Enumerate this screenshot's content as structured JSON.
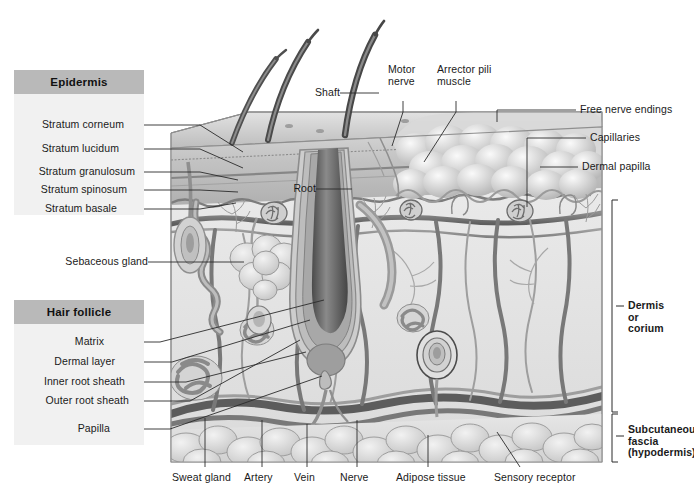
{
  "figure": {
    "type": "anatomical-diagram",
    "palette": {
      "panel_bg": "#f1f1f1",
      "panel_header_bg": "#b9b9b9",
      "epidermis_fill": "#c9c9c9",
      "dermis_fill": "#e8e8e8",
      "vessel_dark": "#6f6f6f",
      "hair_dark": "#5a5a5a",
      "fat_fill": "#dcdcdc",
      "leader_line": "#2a2a2a"
    }
  },
  "panels": [
    {
      "header": "Epidermis",
      "items": [
        "Stratum corneum",
        "Stratum lucidum",
        "Stratum granulosum",
        "Stratum spinosum",
        "Stratum basale"
      ]
    },
    {
      "header": "Hair follicle",
      "items": [
        "Matrix",
        "Dermal layer",
        "Inner root sheath",
        "Outer root sheath",
        "Papilla"
      ]
    }
  ],
  "labels": {
    "shaft": "Shaft",
    "motor_nerve": "Motor\nnerve",
    "arrector_pili": "Arrector pili\nmuscle",
    "free_nerve_endings": "Free nerve endings",
    "capillaries": "Capillaries",
    "dermal_papilla": "Dermal papilla",
    "root": "Root",
    "sebaceous_gland": "Sebaceous gland",
    "dermis": "Dermis\nor\ncorium",
    "subcutaneous": "Subcutaneous\nfascia\n(hypodermis)",
    "sweat_gland": "Sweat gland",
    "artery": "Artery",
    "vein": "Vein",
    "nerve": "Nerve",
    "adipose_tissue": "Adipose tissue",
    "sensory_receptor": "Sensory receptor"
  }
}
